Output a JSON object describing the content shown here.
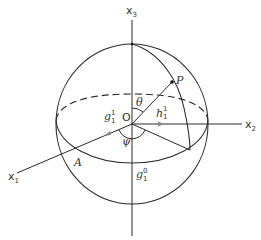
{
  "figure": {
    "axes": {
      "x1": {
        "base": "x",
        "sub": "1"
      },
      "x2": {
        "base": "x",
        "sub": "2"
      },
      "x3": {
        "base": "x",
        "sub": "3"
      }
    },
    "points": {
      "origin": "O",
      "P": "P",
      "A": "A"
    },
    "angles": {
      "theta": "θ",
      "psi": "ψ"
    },
    "vectors": {
      "g11": {
        "base": "g",
        "sup": "1",
        "sub": "1"
      },
      "h11": {
        "base": "h",
        "sup": "1",
        "sub": "1"
      },
      "g10": {
        "base": "g",
        "sup": "0",
        "sub": "1"
      }
    },
    "colors": {
      "line": "#2a2a2a",
      "arrow": "#888888",
      "background": "#ffffff"
    }
  }
}
